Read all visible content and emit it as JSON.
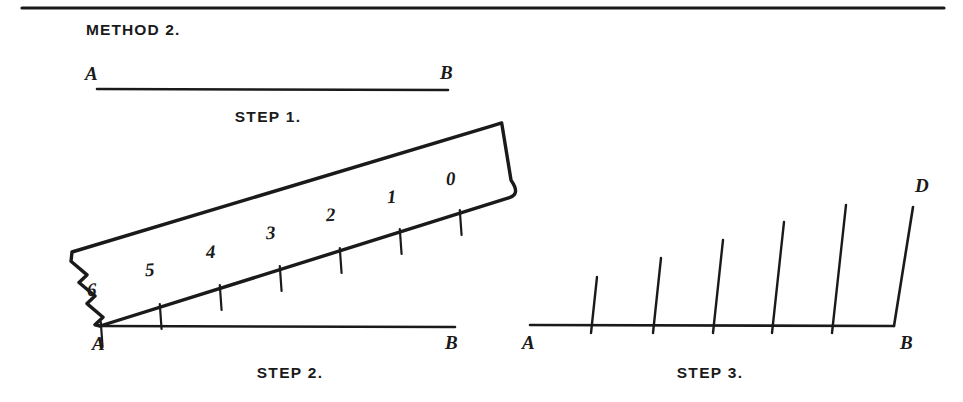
{
  "page": {
    "title": "METHOD 2.",
    "background_color": "#ffffff",
    "ink_color": "#1a1a1a",
    "width": 963,
    "height": 402
  },
  "divider": {
    "name": "top-horizontal-rule",
    "x1": 22,
    "x2": 944,
    "y": 8
  },
  "steps": [
    {
      "id": "step1",
      "caption": "STEP 1.",
      "caption_x": 268,
      "caption_y": 122,
      "line": {
        "x1": 97,
        "y1": 89,
        "x2": 448,
        "y2": 90
      },
      "points": [
        {
          "label": "A",
          "x": 85,
          "y": 80
        },
        {
          "label": "B",
          "x": 440,
          "y": 79
        }
      ]
    },
    {
      "id": "step2",
      "caption": "STEP 2.",
      "caption_x": 290,
      "caption_y": 378,
      "line": {
        "x1": 100,
        "y1": 326,
        "x2": 455,
        "y2": 327
      },
      "points": [
        {
          "label": "A",
          "x": 92,
          "y": 350
        },
        {
          "label": "B",
          "x": 445,
          "y": 349
        }
      ],
      "ruler": {
        "name": "ruler-scale",
        "edge_lower": {
          "x1": 100,
          "y1": 326,
          "x2": 518,
          "y2": 195
        },
        "edge_upper": {
          "x1": 72,
          "y1": 252,
          "x2": 495,
          "y2": 125
        },
        "torn_left_edge": true,
        "rounded_right_end": true,
        "marks": [
          {
            "label": "6",
            "tx": 100,
            "ty": 326,
            "lx": 92,
            "ly": 296
          },
          {
            "label": "5",
            "tx": 159,
            "ty": 308,
            "lx": 150,
            "ly": 276
          },
          {
            "label": "4",
            "tx": 219,
            "ty": 289,
            "lx": 211,
            "ly": 258
          },
          {
            "label": "3",
            "tx": 279,
            "ty": 270,
            "lx": 271,
            "ly": 239
          },
          {
            "label": "2",
            "tx": 339,
            "ty": 252,
            "lx": 331,
            "ly": 221
          },
          {
            "label": "1",
            "tx": 399,
            "ty": 233,
            "lx": 392,
            "ly": 203
          },
          {
            "label": "0",
            "tx": 459,
            "ty": 214,
            "lx": 451,
            "ly": 185
          }
        ]
      }
    },
    {
      "id": "step3",
      "caption": "STEP 3.",
      "caption_x": 710,
      "caption_y": 378,
      "line": {
        "x1": 530,
        "y1": 325,
        "x2": 894,
        "y2": 326
      },
      "points": [
        {
          "label": "A",
          "x": 522,
          "y": 349
        },
        {
          "label": "B",
          "x": 900,
          "y": 349
        },
        {
          "label": "D",
          "x": 915,
          "y": 192
        }
      ],
      "parallel_line": {
        "x1": 894,
        "y1": 326,
        "x2": 913,
        "y2": 207
      },
      "ticks": [
        {
          "x_base": 591,
          "x_top": 597,
          "y_base": 333,
          "y_top": 277
        },
        {
          "x_base": 653,
          "x_top": 661,
          "y_base": 333,
          "y_top": 258
        },
        {
          "x_base": 713,
          "x_top": 723,
          "y_base": 333,
          "y_top": 240
        },
        {
          "x_base": 772,
          "x_top": 784,
          "y_base": 333,
          "y_top": 222
        },
        {
          "x_base": 832,
          "x_top": 846,
          "y_base": 333,
          "y_top": 205
        }
      ]
    }
  ]
}
